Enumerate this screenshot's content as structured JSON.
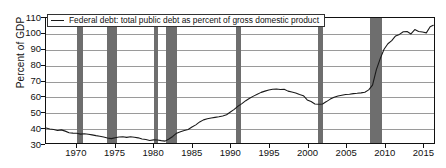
{
  "chart_data": {
    "type": "line",
    "title": "",
    "xlabel": "",
    "ylabel": "Percent of GDP",
    "ylim": [
      30,
      110
    ],
    "xlim": [
      1966.0,
      2016.5
    ],
    "grid": true,
    "legend_position": "top-left",
    "y_ticks": [
      110,
      100,
      90,
      80,
      70,
      60,
      50,
      40,
      30
    ],
    "x_ticks": [
      1970,
      1975,
      1980,
      1985,
      1990,
      1995,
      2000,
      2005,
      2010,
      2015
    ],
    "series": [
      {
        "name": "Federal debt: total public debt as percent of gross domestic product",
        "color": "#1a1a1a",
        "x": [
          1966.0,
          1966.5,
          1967.0,
          1967.5,
          1968.0,
          1968.5,
          1969.0,
          1969.5,
          1970.0,
          1970.5,
          1971.0,
          1971.5,
          1972.0,
          1972.5,
          1973.0,
          1973.5,
          1974.0,
          1974.5,
          1975.0,
          1975.5,
          1976.0,
          1976.5,
          1977.0,
          1977.5,
          1978.0,
          1978.5,
          1979.0,
          1979.5,
          1980.0,
          1980.5,
          1981.0,
          1981.5,
          1982.0,
          1982.5,
          1983.0,
          1983.5,
          1984.0,
          1984.5,
          1985.0,
          1985.5,
          1986.0,
          1986.5,
          1987.0,
          1987.5,
          1988.0,
          1988.5,
          1989.0,
          1989.5,
          1990.0,
          1990.5,
          1991.0,
          1991.5,
          1992.0,
          1992.5,
          1993.0,
          1993.5,
          1994.0,
          1994.5,
          1995.0,
          1995.5,
          1996.0,
          1996.5,
          1997.0,
          1997.5,
          1998.0,
          1998.5,
          1999.0,
          1999.5,
          2000.0,
          2000.5,
          2001.0,
          2001.5,
          2002.0,
          2002.5,
          2003.0,
          2003.5,
          2004.0,
          2004.5,
          2005.0,
          2005.5,
          2006.0,
          2006.5,
          2007.0,
          2007.5,
          2008.0,
          2008.5,
          2009.0,
          2009.5,
          2010.0,
          2010.5,
          2011.0,
          2011.5,
          2012.0,
          2012.5,
          2013.0,
          2013.5,
          2014.0,
          2014.5,
          2015.0,
          2015.5,
          2016.0,
          2016.4
        ],
        "y": [
          39.6,
          39.0,
          38.6,
          38.0,
          38.4,
          37.6,
          36.6,
          36.3,
          36.2,
          35.7,
          35.9,
          35.6,
          35.2,
          34.7,
          34.3,
          33.8,
          33.2,
          32.8,
          33.4,
          33.8,
          34.0,
          33.6,
          34.0,
          33.7,
          33.3,
          32.6,
          32.2,
          31.6,
          32.0,
          31.9,
          31.5,
          31.2,
          32.6,
          34.2,
          36.3,
          37.2,
          38.0,
          38.7,
          40.2,
          41.6,
          43.5,
          44.8,
          45.5,
          46.0,
          46.4,
          46.8,
          47.3,
          48.1,
          49.8,
          51.5,
          53.6,
          55.2,
          57.1,
          58.6,
          60.0,
          61.2,
          62.4,
          63.2,
          63.9,
          64.4,
          64.6,
          64.2,
          64.4,
          63.2,
          62.6,
          62.0,
          61.0,
          60.3,
          57.6,
          56.5,
          55.0,
          54.8,
          55.0,
          56.5,
          58.1,
          59.3,
          60.1,
          60.6,
          61.0,
          61.2,
          61.6,
          61.8,
          62.1,
          62.5,
          64.0,
          67.0,
          77.0,
          84.0,
          90.0,
          93.5,
          95.5,
          98.5,
          99.5,
          101.2,
          101.3,
          99.8,
          102.6,
          101.4,
          101.0,
          100.5,
          104.4,
          105.3
        ]
      }
    ],
    "recessions": {
      "color": "#6e6e6e",
      "label": "recession-shading",
      "periods": [
        {
          "start": 1969.95,
          "end": 1970.85
        },
        {
          "start": 1973.9,
          "end": 1975.2
        },
        {
          "start": 1980.0,
          "end": 1980.55
        },
        {
          "start": 1981.55,
          "end": 1982.9
        },
        {
          "start": 1990.55,
          "end": 1991.2
        },
        {
          "start": 2001.2,
          "end": 2001.9
        },
        {
          "start": 2007.95,
          "end": 2009.45
        }
      ]
    }
  },
  "legend": {
    "entry_label": "Federal debt: total public debt as percent of gross domestic product",
    "line_color": "#1a1a1a"
  },
  "axes": {
    "y_title": "Percent of GDP",
    "y_tick_labels": [
      "110",
      "100",
      "90",
      "80",
      "70",
      "60",
      "50",
      "40",
      "30"
    ],
    "x_tick_labels": [
      "1970",
      "1975",
      "1980",
      "1985",
      "1990",
      "1995",
      "2000",
      "2005",
      "2010",
      "2015"
    ]
  },
  "colors": {
    "line": "#1a1a1a",
    "recession_band": "#6e6e6e",
    "gridline": "#9a9a9a",
    "frame": "#111111",
    "background": "#ffffff"
  }
}
